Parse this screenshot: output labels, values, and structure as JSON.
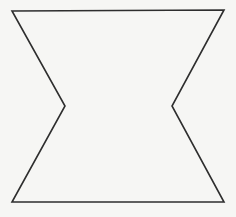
{
  "diagram": {
    "shape": "hexagon-concave",
    "background_color": "#f6f6f4",
    "stroke_color": "#2e2e2e",
    "stroke_width": 1.6,
    "fill_color": "none",
    "vertices": [
      {
        "name": "top-left",
        "x": 12,
        "y": 11
      },
      {
        "name": "top-right",
        "x": 224,
        "y": 10
      },
      {
        "name": "right-inner",
        "x": 172,
        "y": 106
      },
      {
        "name": "bottom-right",
        "x": 224,
        "y": 202
      },
      {
        "name": "bottom-left",
        "x": 12,
        "y": 202
      },
      {
        "name": "left-inner",
        "x": 65,
        "y": 106
      }
    ]
  }
}
